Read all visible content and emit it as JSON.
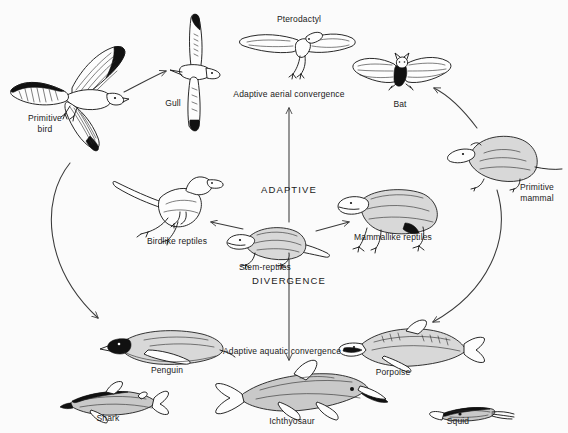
{
  "diagram": {
    "background_color": "#fbfbfb",
    "ink_color": "#111111",
    "axis_labels": {
      "vertical_top": "ADAPTIVE",
      "vertical_bottom": "DIVERGENCE",
      "aerial_convergence": "Adaptive aerial convergence",
      "aquatic_convergence": "Adaptive aquatic convergence"
    },
    "organisms": [
      {
        "id": "primitive-bird",
        "label": "Primitive\nbird",
        "x": 45,
        "y": 119
      },
      {
        "id": "gull",
        "label": "Gull",
        "x": 173,
        "y": 103
      },
      {
        "id": "pterodactyl",
        "label": "Pterodactyl",
        "x": 299,
        "y": 19
      },
      {
        "id": "bat",
        "label": "Bat",
        "x": 400,
        "y": 104
      },
      {
        "id": "primitive-mammal",
        "label": "Primitive\nmammal",
        "x": 539,
        "y": 188
      },
      {
        "id": "birdlike-reptiles",
        "label": "Birdlike reptiles",
        "x": 177,
        "y": 241
      },
      {
        "id": "stem-reptiles",
        "label": "Stem-reptiles",
        "x": 265,
        "y": 267
      },
      {
        "id": "mammallike-reptiles",
        "label": "Mammallike reptiles",
        "x": 393,
        "y": 237
      },
      {
        "id": "penguin",
        "label": "Penguin",
        "x": 167,
        "y": 370
      },
      {
        "id": "porpoise",
        "label": "Porpoise",
        "x": 393,
        "y": 372
      },
      {
        "id": "shark",
        "label": "Shark",
        "x": 108,
        "y": 418
      },
      {
        "id": "ichthyosaur",
        "label": "Ichthyosaur",
        "x": 292,
        "y": 421
      },
      {
        "id": "squid",
        "label": "Squid",
        "x": 458,
        "y": 421
      }
    ],
    "axis_text_positions": [
      {
        "id": "adaptive",
        "text": "ADAPTIVE",
        "x": 289,
        "y": 190
      },
      {
        "id": "divergence",
        "text": "DIVERGENCE",
        "x": 289,
        "y": 281
      },
      {
        "id": "aerial-convergence",
        "text": "Adaptive aerial convergence",
        "x": 289,
        "y": 94
      },
      {
        "id": "aquatic-convergence",
        "text": "Adaptive aquatic convergence",
        "x": 282,
        "y": 351
      }
    ],
    "relations": [
      {
        "from": "primitive-bird",
        "to": "gull",
        "kind": "short-arrow"
      },
      {
        "from": "mammallike-reptiles",
        "to": "primitive-mammal",
        "kind": "short-arrow"
      },
      {
        "from": "stem-reptiles",
        "to": "birdlike-reptiles",
        "kind": "short-arrow"
      },
      {
        "from": "stem-reptiles",
        "to": "mammallike-reptiles",
        "kind": "short-arrow"
      },
      {
        "from": "primitive-mammal",
        "to": "bat",
        "kind": "curved-arrow"
      },
      {
        "from": "primitive-bird",
        "to": "penguin",
        "kind": "curved-arrow"
      },
      {
        "from": "primitive-mammal",
        "to": "porpoise",
        "kind": "curved-arrow"
      },
      {
        "from": "stem-reptiles",
        "to": "aerial-convergence",
        "kind": "axis-arrow-up"
      },
      {
        "from": "stem-reptiles",
        "to": "aquatic-convergence",
        "kind": "axis-arrow-down"
      }
    ]
  }
}
